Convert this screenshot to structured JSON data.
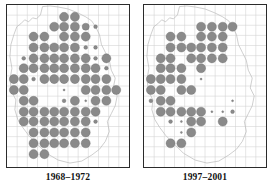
{
  "figure": {
    "type": "distribution-atlas-map-pair",
    "background_color": "#ffffff"
  },
  "style": {
    "dot_fill": "#8a8a8a",
    "dot_stroke": "#6f6f6f",
    "grid_color": "#d0d0d0",
    "outline_color": "#b9b9b9",
    "frame_color": "#2b2b2b",
    "caption_color": "#111111"
  },
  "chart_data": {
    "type": "scatter",
    "title": "",
    "subtitle": "",
    "xlabel": "",
    "ylabel": "",
    "grid": true,
    "legend_position": "none",
    "xlim": [
      0,
      12
    ],
    "ylim": [
      0,
      16
    ],
    "grid_spacing_x": 1,
    "grid_spacing_y": 1,
    "size_levels": {
      "large": 4.6,
      "medium": 3.6,
      "small": 1.9,
      "tiny": 1.0
    },
    "panels": [
      {
        "id": "panel-left",
        "label": "1968–1972",
        "dot_count": 101,
        "outline_path": "M 36,2 L 34,10 L 30,14 L 26,13 L 22,17 L 18,15 L 14,19 L 10,22 L 7,30 L 4,40 L 3,52 L 5,64 L 3,76 L 5,88 L 9,96 L 8,106 L 11,116 L 16,124 L 22,132 L 30,140 L 40,150 L 52,157 L 64,160 L 76,158 L 86,152 L 94,146 L 100,138 L 104,128 L 102,118 L 106,110 L 110,102 L 112,92 L 108,84 L 110,74 L 106,66 L 104,56 L 100,48 L 96,40 L 94,30 L 90,22 L 86,16 L 80,12 L 72,8 L 62,4 L 52,2 L 44,1 Z",
        "dots": [
          {
            "x": 58,
            "y": 12,
            "r": 4.6
          },
          {
            "x": 69,
            "y": 12,
            "r": 4.6
          },
          {
            "x": 48,
            "y": 22,
            "r": 4.6
          },
          {
            "x": 58,
            "y": 22,
            "r": 4.6
          },
          {
            "x": 69,
            "y": 22,
            "r": 4.6
          },
          {
            "x": 80,
            "y": 22,
            "r": 3.6
          },
          {
            "x": 90,
            "y": 22,
            "r": 1.9
          },
          {
            "x": 27,
            "y": 32,
            "r": 4.6
          },
          {
            "x": 38,
            "y": 32,
            "r": 4.6
          },
          {
            "x": 58,
            "y": 32,
            "r": 4.6
          },
          {
            "x": 69,
            "y": 32,
            "r": 4.6
          },
          {
            "x": 80,
            "y": 32,
            "r": 4.6
          },
          {
            "x": 27,
            "y": 43,
            "r": 4.6
          },
          {
            "x": 38,
            "y": 43,
            "r": 4.6
          },
          {
            "x": 48,
            "y": 43,
            "r": 4.6
          },
          {
            "x": 58,
            "y": 43,
            "r": 4.6
          },
          {
            "x": 69,
            "y": 43,
            "r": 4.6
          },
          {
            "x": 80,
            "y": 43,
            "r": 1.9
          },
          {
            "x": 90,
            "y": 43,
            "r": 1.9
          },
          {
            "x": 17,
            "y": 54,
            "r": 1.9
          },
          {
            "x": 27,
            "y": 54,
            "r": 4.6
          },
          {
            "x": 38,
            "y": 54,
            "r": 4.6
          },
          {
            "x": 48,
            "y": 54,
            "r": 4.6
          },
          {
            "x": 58,
            "y": 54,
            "r": 4.6
          },
          {
            "x": 69,
            "y": 54,
            "r": 4.6
          },
          {
            "x": 80,
            "y": 54,
            "r": 4.6
          },
          {
            "x": 90,
            "y": 54,
            "r": 1.9
          },
          {
            "x": 101,
            "y": 54,
            "r": 4.6
          },
          {
            "x": 17,
            "y": 64,
            "r": 4.6
          },
          {
            "x": 27,
            "y": 64,
            "r": 4.6
          },
          {
            "x": 38,
            "y": 64,
            "r": 4.6
          },
          {
            "x": 48,
            "y": 64,
            "r": 4.6
          },
          {
            "x": 58,
            "y": 64,
            "r": 4.6
          },
          {
            "x": 69,
            "y": 64,
            "r": 4.6
          },
          {
            "x": 80,
            "y": 64,
            "r": 4.6
          },
          {
            "x": 90,
            "y": 64,
            "r": 4.6
          },
          {
            "x": 101,
            "y": 64,
            "r": 1.9
          },
          {
            "x": 7,
            "y": 75,
            "r": 4.6
          },
          {
            "x": 17,
            "y": 75,
            "r": 4.6
          },
          {
            "x": 27,
            "y": 75,
            "r": 1.9
          },
          {
            "x": 38,
            "y": 75,
            "r": 4.6
          },
          {
            "x": 48,
            "y": 75,
            "r": 4.6
          },
          {
            "x": 58,
            "y": 75,
            "r": 4.6
          },
          {
            "x": 69,
            "y": 75,
            "r": 4.6
          },
          {
            "x": 80,
            "y": 75,
            "r": 4.6
          },
          {
            "x": 90,
            "y": 75,
            "r": 4.6
          },
          {
            "x": 101,
            "y": 75,
            "r": 4.6
          },
          {
            "x": 7,
            "y": 86,
            "r": 4.6
          },
          {
            "x": 17,
            "y": 86,
            "r": 4.6
          },
          {
            "x": 58,
            "y": 86,
            "r": 1.0
          },
          {
            "x": 80,
            "y": 86,
            "r": 4.6
          },
          {
            "x": 90,
            "y": 86,
            "r": 4.6
          },
          {
            "x": 101,
            "y": 86,
            "r": 4.6
          },
          {
            "x": 111,
            "y": 86,
            "r": 4.6
          },
          {
            "x": 17,
            "y": 97,
            "r": 4.6
          },
          {
            "x": 27,
            "y": 97,
            "r": 4.6
          },
          {
            "x": 58,
            "y": 97,
            "r": 1.9
          },
          {
            "x": 69,
            "y": 97,
            "r": 4.6
          },
          {
            "x": 80,
            "y": 97,
            "r": 1.0
          },
          {
            "x": 90,
            "y": 97,
            "r": 4.6
          },
          {
            "x": 101,
            "y": 97,
            "r": 4.6
          },
          {
            "x": 17,
            "y": 108,
            "r": 4.6
          },
          {
            "x": 27,
            "y": 108,
            "r": 4.6
          },
          {
            "x": 38,
            "y": 108,
            "r": 4.6
          },
          {
            "x": 48,
            "y": 108,
            "r": 4.6
          },
          {
            "x": 58,
            "y": 108,
            "r": 4.6
          },
          {
            "x": 69,
            "y": 108,
            "r": 4.6
          },
          {
            "x": 80,
            "y": 108,
            "r": 4.6
          },
          {
            "x": 90,
            "y": 108,
            "r": 4.6
          },
          {
            "x": 17,
            "y": 118,
            "r": 4.6
          },
          {
            "x": 27,
            "y": 118,
            "r": 4.6
          },
          {
            "x": 38,
            "y": 118,
            "r": 4.6
          },
          {
            "x": 48,
            "y": 118,
            "r": 4.6
          },
          {
            "x": 58,
            "y": 118,
            "r": 4.6
          },
          {
            "x": 69,
            "y": 118,
            "r": 4.6
          },
          {
            "x": 80,
            "y": 118,
            "r": 4.6
          },
          {
            "x": 90,
            "y": 118,
            "r": 1.9
          },
          {
            "x": 27,
            "y": 129,
            "r": 4.6
          },
          {
            "x": 38,
            "y": 129,
            "r": 4.6
          },
          {
            "x": 48,
            "y": 129,
            "r": 4.6
          },
          {
            "x": 58,
            "y": 129,
            "r": 4.6
          },
          {
            "x": 69,
            "y": 129,
            "r": 4.6
          },
          {
            "x": 80,
            "y": 129,
            "r": 4.6
          },
          {
            "x": 27,
            "y": 140,
            "r": 4.6
          },
          {
            "x": 38,
            "y": 140,
            "r": 4.6
          },
          {
            "x": 48,
            "y": 140,
            "r": 4.6
          },
          {
            "x": 58,
            "y": 140,
            "r": 4.6
          },
          {
            "x": 69,
            "y": 140,
            "r": 4.6
          },
          {
            "x": 80,
            "y": 140,
            "r": 4.6
          },
          {
            "x": 27,
            "y": 151,
            "r": 4.6
          },
          {
            "x": 38,
            "y": 151,
            "r": 4.6
          }
        ]
      },
      {
        "id": "panel-right",
        "label": "1997–2001",
        "dot_count": 60,
        "outline_path": "M 36,2 L 34,10 L 30,14 L 26,13 L 22,17 L 18,15 L 14,19 L 10,22 L 7,30 L 4,40 L 3,52 L 5,64 L 3,76 L 5,88 L 9,96 L 8,106 L 11,116 L 16,124 L 22,132 L 30,140 L 40,150 L 52,157 L 64,160 L 76,158 L 86,152 L 94,146 L 100,138 L 104,128 L 102,118 L 106,110 L 110,102 L 112,92 L 108,84 L 110,74 L 106,66 L 104,56 L 100,48 L 96,40 L 94,30 L 90,22 L 86,16 L 80,12 L 72,8 L 62,4 L 52,2 L 44,1 Z",
        "dots": [
          {
            "x": 58,
            "y": 22,
            "r": 4.6
          },
          {
            "x": 69,
            "y": 22,
            "r": 4.6
          },
          {
            "x": 80,
            "y": 22,
            "r": 4.6
          },
          {
            "x": 90,
            "y": 22,
            "r": 4.6
          },
          {
            "x": 27,
            "y": 32,
            "r": 4.6
          },
          {
            "x": 38,
            "y": 32,
            "r": 4.6
          },
          {
            "x": 58,
            "y": 32,
            "r": 4.6
          },
          {
            "x": 69,
            "y": 32,
            "r": 4.6
          },
          {
            "x": 80,
            "y": 32,
            "r": 4.6
          },
          {
            "x": 27,
            "y": 43,
            "r": 4.6
          },
          {
            "x": 38,
            "y": 43,
            "r": 4.6
          },
          {
            "x": 48,
            "y": 43,
            "r": 4.6
          },
          {
            "x": 58,
            "y": 43,
            "r": 4.6
          },
          {
            "x": 69,
            "y": 43,
            "r": 4.6
          },
          {
            "x": 80,
            "y": 43,
            "r": 4.6
          },
          {
            "x": 17,
            "y": 54,
            "r": 4.6
          },
          {
            "x": 27,
            "y": 54,
            "r": 4.6
          },
          {
            "x": 48,
            "y": 54,
            "r": 4.6
          },
          {
            "x": 58,
            "y": 54,
            "r": 4.6
          },
          {
            "x": 69,
            "y": 54,
            "r": 4.6
          },
          {
            "x": 80,
            "y": 54,
            "r": 4.6
          },
          {
            "x": 17,
            "y": 64,
            "r": 4.6
          },
          {
            "x": 27,
            "y": 64,
            "r": 4.6
          },
          {
            "x": 38,
            "y": 64,
            "r": 4.6
          },
          {
            "x": 58,
            "y": 64,
            "r": 4.6
          },
          {
            "x": 7,
            "y": 75,
            "r": 4.6
          },
          {
            "x": 17,
            "y": 75,
            "r": 4.6
          },
          {
            "x": 27,
            "y": 75,
            "r": 4.6
          },
          {
            "x": 38,
            "y": 75,
            "r": 4.6
          },
          {
            "x": 58,
            "y": 75,
            "r": 1.0
          },
          {
            "x": 7,
            "y": 86,
            "r": 4.6
          },
          {
            "x": 17,
            "y": 86,
            "r": 4.6
          },
          {
            "x": 38,
            "y": 86,
            "r": 4.6
          },
          {
            "x": 48,
            "y": 86,
            "r": 4.6
          },
          {
            "x": 7,
            "y": 97,
            "r": 1.9
          },
          {
            "x": 17,
            "y": 97,
            "r": 4.6
          },
          {
            "x": 27,
            "y": 97,
            "r": 4.6
          },
          {
            "x": 90,
            "y": 97,
            "r": 1.0
          },
          {
            "x": 17,
            "y": 108,
            "r": 4.6
          },
          {
            "x": 27,
            "y": 108,
            "r": 4.6
          },
          {
            "x": 38,
            "y": 108,
            "r": 4.6
          },
          {
            "x": 48,
            "y": 108,
            "r": 4.6
          },
          {
            "x": 58,
            "y": 108,
            "r": 4.6
          },
          {
            "x": 69,
            "y": 108,
            "r": 1.0
          },
          {
            "x": 80,
            "y": 108,
            "r": 1.0
          },
          {
            "x": 90,
            "y": 108,
            "r": 1.9
          },
          {
            "x": 27,
            "y": 118,
            "r": 1.9
          },
          {
            "x": 38,
            "y": 118,
            "r": 1.0
          },
          {
            "x": 48,
            "y": 118,
            "r": 4.6
          },
          {
            "x": 58,
            "y": 118,
            "r": 4.6
          },
          {
            "x": 80,
            "y": 118,
            "r": 4.6
          },
          {
            "x": 38,
            "y": 129,
            "r": 1.0
          },
          {
            "x": 48,
            "y": 129,
            "r": 4.6
          },
          {
            "x": 27,
            "y": 140,
            "r": 4.6
          },
          {
            "x": 38,
            "y": 140,
            "r": 4.6
          }
        ]
      }
    ]
  },
  "captions": {
    "left": "1968–1972",
    "right": "1997–2001"
  }
}
